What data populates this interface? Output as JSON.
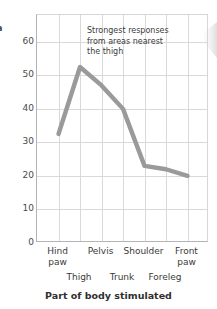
{
  "chart_data": {
    "type": "line",
    "title": "",
    "xlabel": "Part of body stimulated",
    "ylabel": "a",
    "categories": [
      "Hind paw",
      "Thigh",
      "Pelvis",
      "Trunk",
      "Shoulder",
      "Foreleg",
      "Front paw"
    ],
    "values": [
      32.5,
      52.5,
      47,
      40,
      23,
      22,
      20
    ],
    "ylim": [
      0,
      68
    ],
    "yticks": [
      0,
      10,
      20,
      30,
      40,
      50,
      60
    ],
    "ytick_labels": [
      "0",
      "10",
      "20",
      "30",
      "40",
      "50",
      "60"
    ],
    "grid": true,
    "legend": "none",
    "line_color": "#9a9a9a",
    "grid_color": "#d9d9d9",
    "axis_color": "#b4b4b4",
    "annotations": [
      {
        "name": "strongest-responses-note",
        "lines": [
          "Strongest responses",
          "from areas nearest",
          "the thigh"
        ]
      }
    ]
  },
  "axis": {
    "y_caption": "a",
    "x_title": "Part of body stimulated",
    "x_labels_upper": [
      {
        "label": "Hind paw",
        "line1": "Hind",
        "line2": "paw"
      },
      {
        "label": "Pelvis",
        "line1": "Pelvis",
        "line2": ""
      },
      {
        "label": "Shoulder",
        "line1": "Shoulder",
        "line2": ""
      },
      {
        "label": "Front paw",
        "line1": "Front",
        "line2": "paw"
      }
    ],
    "x_labels_lower": [
      "Thigh",
      "Trunk",
      "Foreleg"
    ],
    "y_tick_labels": [
      "60",
      "50",
      "40",
      "30",
      "20",
      "10",
      "0"
    ]
  },
  "annotation": {
    "line1": "Strongest responses",
    "line2": "from areas nearest",
    "line3": "the thigh"
  }
}
